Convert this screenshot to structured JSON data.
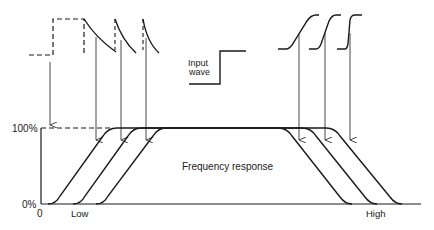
{
  "diagram": {
    "type": "square-wave frequency response illustration",
    "colors": {
      "ink": "#1a1a1a",
      "arrow": "#333333",
      "background": "#ffffff"
    },
    "labels": {
      "input_wave_line1": "Input",
      "input_wave_line2": "wave",
      "frequency_response": "Frequency response",
      "y_top": "100%",
      "y_bottom": "0%",
      "x_origin": "0",
      "x_low": "Low",
      "x_high": "High"
    },
    "top_left_waveforms": {
      "description": "Low-frequency distortion: differentiated (tilted) step responses",
      "count": 3
    },
    "top_right_waveforms": {
      "description": "High-frequency distortion: slowed rise-time step responses",
      "count": 3
    },
    "response_curves": {
      "count": 3,
      "low_edge_arrow_x": [
        96,
        121,
        146
      ],
      "high_edge_arrow_x": [
        299,
        325,
        350
      ]
    }
  }
}
